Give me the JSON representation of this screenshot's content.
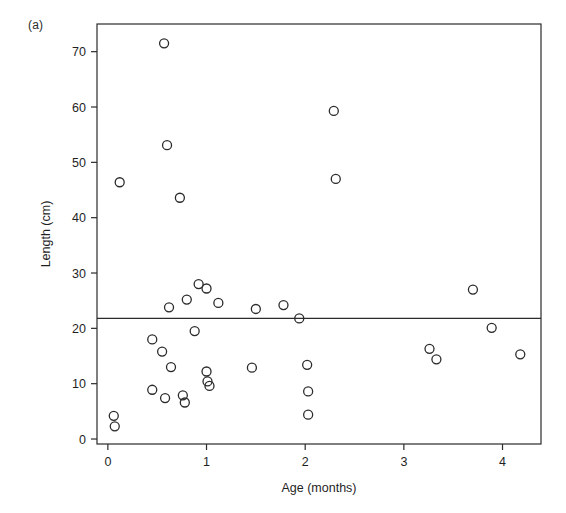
{
  "figure": {
    "panel_label": "(a)",
    "background_color": "#ffffff",
    "ink_color": "#2b2b2b"
  },
  "chart_data": {
    "type": "scatter",
    "title": "",
    "subtitle": "",
    "xlabel": "Age (months)",
    "ylabel": "Length (cm)",
    "xlim": [
      -0.11,
      4.39
    ],
    "ylim": [
      -0.9,
      75.0
    ],
    "xticks": [
      0,
      1,
      2,
      3,
      4
    ],
    "xticklabels": [
      "0",
      "1",
      "2",
      "3",
      "4"
    ],
    "yticks": [
      0,
      10,
      20,
      30,
      40,
      50,
      60,
      70
    ],
    "yticklabels": [
      "0",
      "10",
      "20",
      "30",
      "40",
      "50",
      "60",
      "70"
    ],
    "grid": false,
    "legend": null,
    "marker": "open-circle",
    "marker_size_px": 9,
    "annotations": [
      {
        "type": "horizontal-line",
        "y": 21.8,
        "label": "",
        "spans_full_width": true
      }
    ],
    "series": [
      {
        "name": "Individuals",
        "points": [
          {
            "x": 0.06,
            "y": 4.2
          },
          {
            "x": 0.07,
            "y": 2.3
          },
          {
            "x": 0.12,
            "y": 46.4
          },
          {
            "x": 0.45,
            "y": 18.0
          },
          {
            "x": 0.45,
            "y": 8.9
          },
          {
            "x": 0.55,
            "y": 15.8
          },
          {
            "x": 0.57,
            "y": 71.5
          },
          {
            "x": 0.58,
            "y": 7.4
          },
          {
            "x": 0.6,
            "y": 53.1
          },
          {
            "x": 0.62,
            "y": 23.8
          },
          {
            "x": 0.64,
            "y": 13.0
          },
          {
            "x": 0.73,
            "y": 43.6
          },
          {
            "x": 0.76,
            "y": 7.9
          },
          {
            "x": 0.78,
            "y": 6.6
          },
          {
            "x": 0.8,
            "y": 25.2
          },
          {
            "x": 0.88,
            "y": 19.5
          },
          {
            "x": 0.92,
            "y": 28.0
          },
          {
            "x": 1.0,
            "y": 27.2
          },
          {
            "x": 1.0,
            "y": 12.2
          },
          {
            "x": 1.01,
            "y": 10.4
          },
          {
            "x": 1.03,
            "y": 9.6
          },
          {
            "x": 1.12,
            "y": 24.6
          },
          {
            "x": 1.46,
            "y": 12.9
          },
          {
            "x": 1.5,
            "y": 23.5
          },
          {
            "x": 1.78,
            "y": 24.2
          },
          {
            "x": 1.94,
            "y": 21.8
          },
          {
            "x": 2.02,
            "y": 13.4
          },
          {
            "x": 2.03,
            "y": 8.6
          },
          {
            "x": 2.03,
            "y": 4.4
          },
          {
            "x": 2.29,
            "y": 59.3
          },
          {
            "x": 2.31,
            "y": 47.0
          },
          {
            "x": 3.26,
            "y": 16.3
          },
          {
            "x": 3.33,
            "y": 14.4
          },
          {
            "x": 3.7,
            "y": 27.0
          },
          {
            "x": 3.89,
            "y": 20.1
          },
          {
            "x": 4.18,
            "y": 15.3
          }
        ]
      }
    ]
  }
}
